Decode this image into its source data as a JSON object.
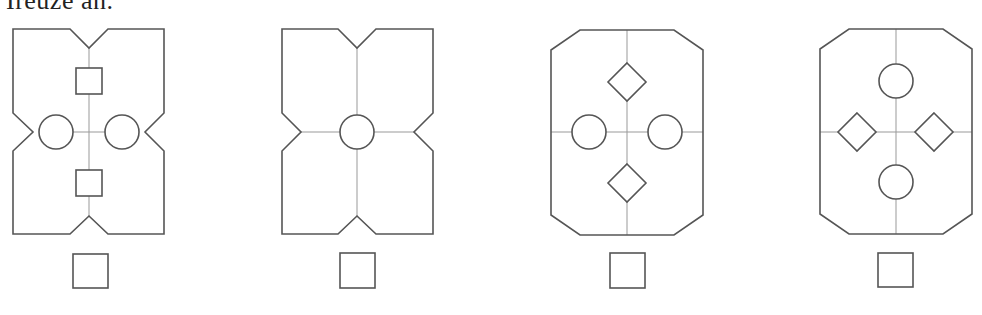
{
  "header": {
    "text": "Ireuze an."
  },
  "figures": [
    {
      "id": 1,
      "outline": "notched",
      "bounds": {
        "x": 13,
        "y": 29,
        "w": 151,
        "h": 205
      },
      "center": {
        "x": 89,
        "y": 132
      },
      "guides": "center-cross-partial",
      "elements": [
        {
          "type": "square",
          "cx": 89,
          "cy": 81,
          "size": 26
        },
        {
          "type": "square",
          "cx": 89,
          "cy": 183,
          "size": 26
        },
        {
          "type": "circle",
          "cx": 56,
          "cy": 132,
          "r": 17
        },
        {
          "type": "circle",
          "cx": 122,
          "cy": 132,
          "r": 17
        }
      ],
      "answer_box": {
        "x": 73,
        "y": 254,
        "size": 35
      }
    },
    {
      "id": 2,
      "outline": "notched",
      "bounds": {
        "x": 282,
        "y": 29,
        "w": 151,
        "h": 205
      },
      "center": {
        "x": 357,
        "y": 132
      },
      "guides": "full-cross",
      "elements": [
        {
          "type": "circle",
          "cx": 357,
          "cy": 132,
          "r": 17
        }
      ],
      "answer_box": {
        "x": 340,
        "y": 253,
        "size": 35
      }
    },
    {
      "id": 3,
      "outline": "chamfered",
      "bounds": {
        "x": 551,
        "y": 30,
        "w": 152,
        "h": 205
      },
      "center": {
        "x": 627,
        "y": 132
      },
      "guides": "full-cross",
      "elements": [
        {
          "type": "diamond",
          "cx": 627,
          "cy": 82,
          "half": 19
        },
        {
          "type": "diamond",
          "cx": 627,
          "cy": 183,
          "half": 19
        },
        {
          "type": "circle",
          "cx": 589,
          "cy": 132,
          "r": 17
        },
        {
          "type": "circle",
          "cx": 665,
          "cy": 132,
          "r": 17
        }
      ],
      "answer_box": {
        "x": 610,
        "y": 253,
        "size": 35
      }
    },
    {
      "id": 4,
      "outline": "chamfered",
      "bounds": {
        "x": 820,
        "y": 29,
        "w": 152,
        "h": 205
      },
      "center": {
        "x": 896,
        "y": 132
      },
      "guides": "full-cross",
      "elements": [
        {
          "type": "circle",
          "cx": 896,
          "cy": 81,
          "r": 17
        },
        {
          "type": "circle",
          "cx": 896,
          "cy": 182,
          "r": 17
        },
        {
          "type": "diamond",
          "cx": 857,
          "cy": 132,
          "half": 19
        },
        {
          "type": "diamond",
          "cx": 934,
          "cy": 132,
          "half": 19
        }
      ],
      "answer_box": {
        "x": 878,
        "y": 253,
        "size": 35
      }
    }
  ],
  "colors": {
    "stroke": "#555555",
    "guide": "#999999",
    "background": "#ffffff"
  }
}
